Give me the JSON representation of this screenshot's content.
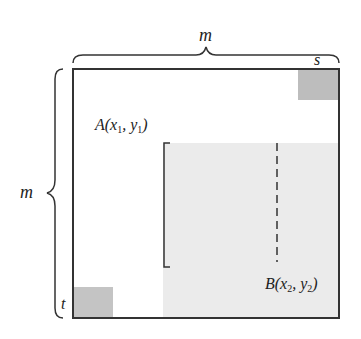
{
  "diagram": {
    "top_brace_label": "m",
    "left_brace_label": "m",
    "corner_top_right_label": "s",
    "corner_bottom_left_label": "t",
    "point_a": {
      "name": "A",
      "x": "x",
      "x_sub": "1",
      "y": "y",
      "y_sub": "1"
    },
    "point_b": {
      "name": "B",
      "x": "x",
      "x_sub": "2",
      "y": "y",
      "y_sub": "2"
    },
    "colors": {
      "border": "#333333",
      "shaded_square": "#bdbdbd",
      "region": "#e9e9e9"
    }
  }
}
